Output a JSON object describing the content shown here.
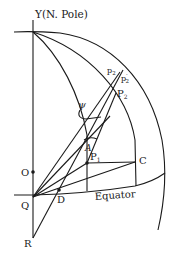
{
  "figure": {
    "type": "geometric-diagram",
    "labels": {
      "pole": "Y(N. Pole)",
      "equator": "Equator",
      "O": "O",
      "Q": "Q",
      "D": "D",
      "R": "R",
      "C": "C",
      "A": "A",
      "psi": "ψ",
      "P1": "P",
      "P1_sub": "1",
      "P2": "P",
      "P2_sub": "2",
      "p2a": "p",
      "p2a_sub": "2",
      "p2b": "p",
      "p2b_sub": "2",
      "p2b_prime": "′"
    },
    "colors": {
      "ink": "#1a1a1a",
      "background": "#ffffff"
    }
  }
}
